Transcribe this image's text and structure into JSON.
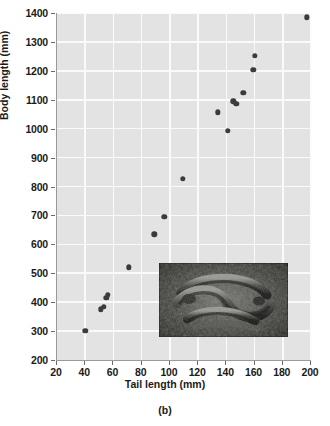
{
  "chart_data": {
    "type": "scatter",
    "title": "",
    "xlabel": "Tail length (mm)",
    "ylabel": "Body length (mm)",
    "xlim": [
      20,
      200
    ],
    "ylim": [
      200,
      1400
    ],
    "xticks": [
      20,
      40,
      60,
      80,
      100,
      120,
      140,
      160,
      180,
      200
    ],
    "yticks": [
      200,
      300,
      400,
      500,
      600,
      700,
      800,
      900,
      1000,
      1100,
      1200,
      1300,
      1400
    ],
    "grid": true,
    "legend": null,
    "panel_label": "(b)",
    "marker_color": "#3b3b3b",
    "plot_background": "#e3e3e3",
    "gridline_color": "#fafafa",
    "x": [
      40,
      51,
      53,
      55,
      56,
      71,
      89,
      96,
      109,
      134,
      141,
      145,
      147,
      152,
      159,
      160,
      197
    ],
    "y": [
      300,
      375,
      383,
      415,
      425,
      520,
      635,
      695,
      827,
      1057,
      993,
      1095,
      1085,
      1125,
      1203,
      1253,
      1385
    ],
    "points": [
      {
        "tail_length_mm": 40,
        "body_length_mm": 300
      },
      {
        "tail_length_mm": 51,
        "body_length_mm": 375
      },
      {
        "tail_length_mm": 53,
        "body_length_mm": 383
      },
      {
        "tail_length_mm": 55,
        "body_length_mm": 415
      },
      {
        "tail_length_mm": 56,
        "body_length_mm": 425
      },
      {
        "tail_length_mm": 71,
        "body_length_mm": 520
      },
      {
        "tail_length_mm": 89,
        "body_length_mm": 635
      },
      {
        "tail_length_mm": 96,
        "body_length_mm": 695
      },
      {
        "tail_length_mm": 109,
        "body_length_mm": 827
      },
      {
        "tail_length_mm": 134,
        "body_length_mm": 1057
      },
      {
        "tail_length_mm": 141,
        "body_length_mm": 993
      },
      {
        "tail_length_mm": 145,
        "body_length_mm": 1095
      },
      {
        "tail_length_mm": 147,
        "body_length_mm": 1085
      },
      {
        "tail_length_mm": 152,
        "body_length_mm": 1125
      },
      {
        "tail_length_mm": 159,
        "body_length_mm": 1203
      },
      {
        "tail_length_mm": 160,
        "body_length_mm": 1253
      },
      {
        "tail_length_mm": 197,
        "body_length_mm": 1385
      }
    ],
    "inset": {
      "name": "snake-photograph",
      "description": "dark photograph of coiled snakes on ground"
    }
  }
}
